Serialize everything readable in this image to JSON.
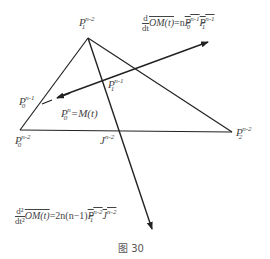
{
  "figure": {
    "caption": "图 30",
    "stroke_color": "#222222",
    "background": "#ffffff"
  },
  "points": {
    "P1_n2": {
      "base": "P",
      "sub": "1",
      "sup": "n-2"
    },
    "P0_n2": {
      "base": "P",
      "sub": "0",
      "sup": "n-2"
    },
    "P2_n2": {
      "base": "P",
      "sub": "2",
      "sup": "n-2"
    },
    "P0_n1": {
      "base": "P",
      "sub": "0",
      "sup": "n-1"
    },
    "P1_n1": {
      "base": "P",
      "sub": "1",
      "sup": "n-1"
    },
    "J_n2": {
      "base": "J",
      "sup": "n-2"
    },
    "P0_n": {
      "base": "P",
      "sub": "0",
      "sup": "n",
      "eq": "=M(t)"
    }
  },
  "formulas": {
    "first_derivative": {
      "num": "d",
      "den": "dt",
      "lhs": "OM(t)",
      "eq": "=n",
      "rhs": "P0^{n-1}P1^{n-1}",
      "rhs_parts": [
        "P",
        "0",
        "n-1",
        "P",
        "1",
        "n-1"
      ]
    },
    "second_derivative": {
      "num": "d²",
      "den": "dt²",
      "lhs": "OM(t)",
      "eq": "=2n(n−1)",
      "rhs": "P1^{n-2}J^{n-2}",
      "rhs_parts": [
        "P",
        "1",
        "n-2",
        "J",
        "n-2"
      ]
    }
  }
}
